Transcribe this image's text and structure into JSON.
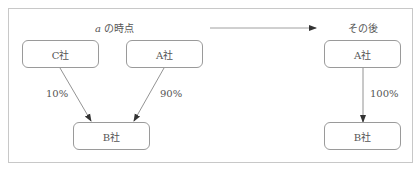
{
  "diagram": {
    "left_panel": {
      "title_var": "a",
      "title_rest": " の時点",
      "nodes": {
        "c": "C社",
        "a": "A社",
        "b": "B社"
      },
      "edges": [
        {
          "from": "C社",
          "to": "B社",
          "label": "10%"
        },
        {
          "from": "A社",
          "to": "B社",
          "label": "90%"
        }
      ]
    },
    "transition_arrow": "right-arrow",
    "right_panel": {
      "title": "その後",
      "nodes": {
        "a": "A社",
        "b": "B社"
      },
      "edges": [
        {
          "from": "A社",
          "to": "B社",
          "label": "100%"
        }
      ]
    },
    "colors": {
      "border": "#9a9a9a",
      "frame": "#c8c8c8",
      "text": "#555555",
      "arrow": "#444444"
    }
  }
}
